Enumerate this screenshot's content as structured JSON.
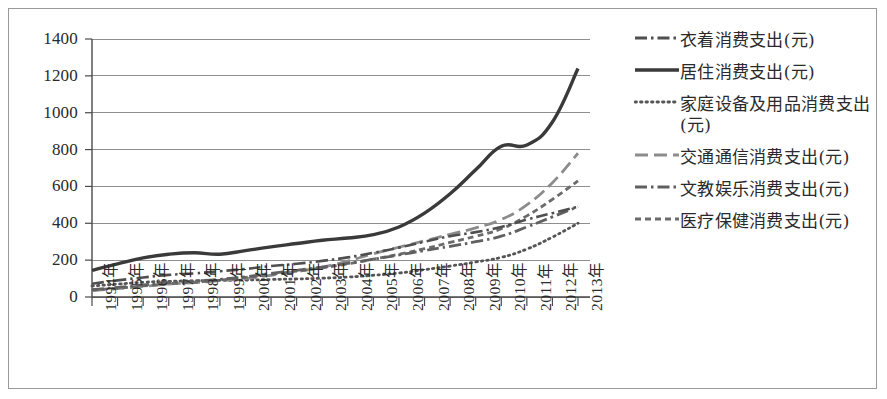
{
  "chart_data": {
    "type": "line",
    "title": "",
    "subtitle": "",
    "xlabel": "",
    "ylabel": "",
    "ylim": [
      0,
      1400
    ],
    "ytick_step": 200,
    "yticks": [
      "0",
      "200",
      "400",
      "600",
      "800",
      "1000",
      "1200",
      "1400"
    ],
    "grid": true,
    "legend_position": "right",
    "categories": [
      "1994年",
      "1995年",
      "1996年",
      "1997年",
      "1998年",
      "1999年",
      "2000年",
      "2001年",
      "2002年",
      "2003年",
      "2004年",
      "2005年",
      "2006年",
      "2007年",
      "2008年",
      "2009年",
      "2010年",
      "2011年",
      "2012年",
      "2013年"
    ],
    "series": [
      {
        "name": "衣着消费支出(元)",
        "style": "dashdot",
        "color": "#4f4f4f",
        "width": 2.6,
        "values": [
          72,
          90,
          106,
          120,
          128,
          140,
          152,
          168,
          180,
          196,
          215,
          240,
          268,
          300,
          330,
          352,
          380,
          420,
          455,
          490
        ]
      },
      {
        "name": "居住消费支出(元)",
        "style": "solid",
        "color": "#3a3a3a",
        "width": 3.4,
        "values": [
          145,
          180,
          212,
          232,
          240,
          232,
          252,
          272,
          290,
          308,
          320,
          338,
          380,
          455,
          560,
          690,
          818,
          825,
          950,
          1240
        ]
      },
      {
        "name": "家庭设备及用品消费支出(元)",
        "style": "dotted",
        "color": "#555555",
        "width": 2.8,
        "values": [
          60,
          70,
          80,
          85,
          88,
          90,
          92,
          95,
          98,
          102,
          108,
          118,
          130,
          148,
          168,
          190,
          215,
          260,
          325,
          400
        ]
      },
      {
        "name": "交通通信消费支出(元)",
        "style": "longdash",
        "color": "#8c8c8c",
        "width": 2.8,
        "values": [
          35,
          45,
          58,
          70,
          78,
          88,
          100,
          118,
          138,
          162,
          195,
          235,
          270,
          305,
          340,
          375,
          420,
          500,
          620,
          780
        ]
      },
      {
        "name": "文教娱乐消费支出(元)",
        "style": "dashdot",
        "color": "#606060",
        "width": 2.8,
        "values": [
          40,
          52,
          66,
          78,
          86,
          96,
          110,
          128,
          145,
          162,
          182,
          205,
          228,
          252,
          275,
          300,
          330,
          380,
          435,
          490
        ]
      },
      {
        "name": "医疗保健消费支出(元)",
        "style": "shortdash",
        "color": "#6b6b6b",
        "width": 2.8,
        "values": [
          38,
          48,
          60,
          72,
          80,
          92,
          106,
          122,
          140,
          158,
          180,
          205,
          232,
          262,
          296,
          330,
          370,
          440,
          530,
          630
        ]
      }
    ]
  },
  "legend": {
    "items": [
      {
        "label": "衣着消费支出(元)",
        "swatch": "dashdot-line-icon"
      },
      {
        "label": "居住消费支出(元)",
        "swatch": "solid-line-icon"
      },
      {
        "label": "家庭设备及用品消费支出(元)",
        "swatch": "dotted-line-icon"
      },
      {
        "label": "交通通信消费支出(元)",
        "swatch": "longdash-line-icon"
      },
      {
        "label": "文教娱乐消费支出(元)",
        "swatch": "dashdot-line-icon"
      },
      {
        "label": "医疗保健消费支出(元)",
        "swatch": "shortdash-line-icon"
      }
    ]
  }
}
